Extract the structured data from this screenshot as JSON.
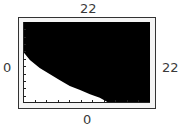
{
  "window_labels": {
    "ymax": "22",
    "ymin": "0",
    "xmin": "0",
    "xmax": "22"
  },
  "colors": {
    "shaded_region": "#000000",
    "unshaded_region": "#ffffff",
    "frame_border": "#333333",
    "frame_fill": "#f4f4f4",
    "label_text": "#3a3a3a"
  },
  "chart_data": {
    "type": "area",
    "title": "",
    "xlabel": "",
    "ylabel": "",
    "xlim": [
      0,
      22
    ],
    "ylim": [
      0,
      22
    ],
    "x_tick_spacing": 2,
    "y_tick_spacing": 2,
    "grid": false,
    "legend": null,
    "annotations": [
      "Window labels: top=22 (Ymax), bottom=0 (Ymin), left=0 (Xmin), right=22 (Xmax)"
    ],
    "series": [
      {
        "name": "boundary curve",
        "x": [
          0.2,
          1.2,
          2.9,
          4.6,
          6.4,
          8.1,
          9.9,
          11.6,
          13.3,
          14.6
        ],
        "y": [
          13.6,
          11.7,
          9.5,
          7.9,
          6.2,
          4.6,
          3.5,
          2.4,
          1.4,
          0.3
        ]
      }
    ]
  }
}
